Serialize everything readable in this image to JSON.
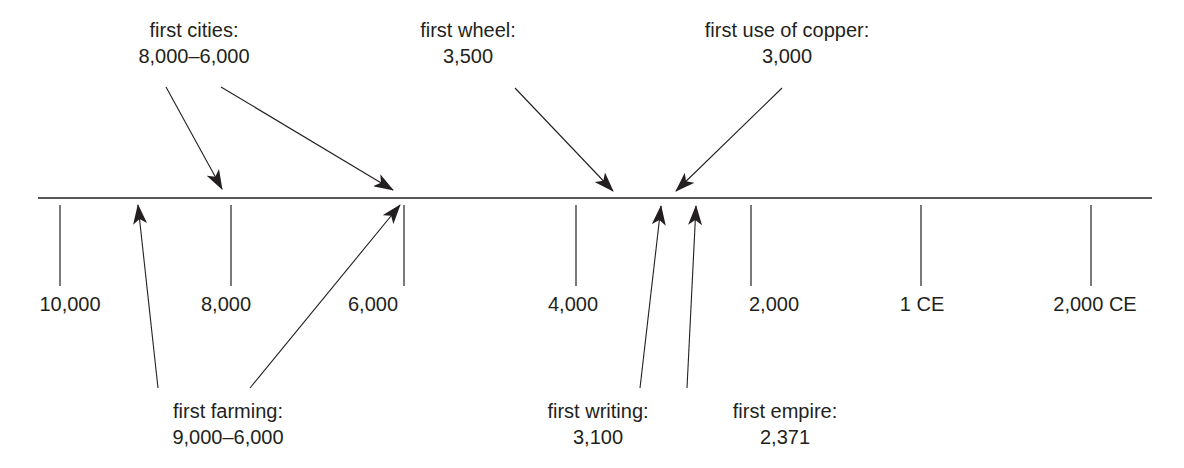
{
  "diagram": {
    "type": "timeline",
    "axis": {
      "ticks": [
        {
          "label": "10,000",
          "x": 60
        },
        {
          "label": "8,000",
          "x": 231
        },
        {
          "label": "6,000",
          "x": 404
        },
        {
          "label": "4,000",
          "x": 576
        },
        {
          "label": "2,000",
          "x": 751
        },
        {
          "label": "1 CE",
          "x": 921
        },
        {
          "label": "2,000 CE",
          "x": 1091
        }
      ]
    },
    "events_above": [
      {
        "title": "first cities:",
        "date": "8,000–6,000"
      },
      {
        "title": "first wheel:",
        "date": "3,500"
      },
      {
        "title": "first use of copper:",
        "date": "3,000"
      }
    ],
    "events_below": [
      {
        "title": "first farming:",
        "date": "9,000–6,000"
      },
      {
        "title": "first writing:",
        "date": "3,100"
      },
      {
        "title": "first empire:",
        "date": "2,371"
      }
    ],
    "line_color": "#231f20"
  }
}
